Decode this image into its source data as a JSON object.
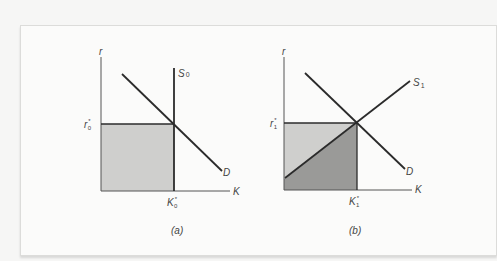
{
  "figure": {
    "panel_a": {
      "caption": "(a)",
      "y_axis_label": "r",
      "x_axis_label": "K",
      "supply_label": "S",
      "supply_sub": "0",
      "demand_label": "D",
      "rate_label": "r",
      "rate_sup": "*",
      "rate_sub": "0",
      "capital_label": "K",
      "capital_sup": "*",
      "capital_sub": "0"
    },
    "panel_b": {
      "caption": "(b)",
      "y_axis_label": "r",
      "x_axis_label": "K",
      "supply_label": "S",
      "supply_sub": "1",
      "demand_label": "D",
      "rate_label": "r",
      "rate_sup": "*",
      "rate_sub": "1",
      "capital_label": "K",
      "capital_sup": "*",
      "capital_sub": "1"
    },
    "colors": {
      "line": "#2b2b2b",
      "axis": "#555555",
      "fill_light": "#cfcfcd",
      "fill_dark": "#9a9a98"
    }
  }
}
